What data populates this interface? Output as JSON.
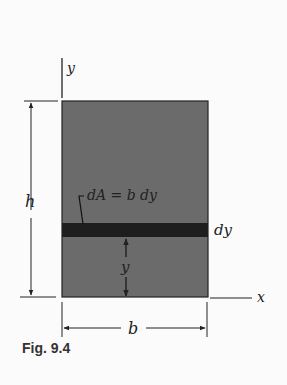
{
  "figure": {
    "caption": "Fig. 9.4",
    "labels": {
      "y_axis": "y",
      "x_axis": "x",
      "height": "h",
      "width": "b",
      "strip_thickness": "dy",
      "strip_distance": "y",
      "area_element": "dA = b dy"
    },
    "colors": {
      "rectangle_fill": "#6b6b6b",
      "strip_fill": "#1e1e1e",
      "line": "#222222",
      "background": "#fbfbfb"
    }
  }
}
